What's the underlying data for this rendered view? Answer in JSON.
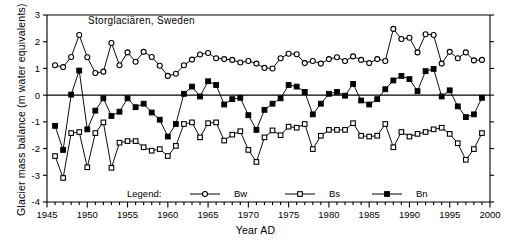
{
  "chart_data": {
    "type": "line",
    "title": "Storglaciären, Sweden",
    "xlabel": "Year AD",
    "ylabel": "Glacier mass balance (m water equivalents)",
    "xlim": [
      1945,
      2000
    ],
    "ylim": [
      -4,
      3
    ],
    "xticks_major": [
      1945,
      1950,
      1955,
      1960,
      1965,
      1970,
      1975,
      1980,
      1985,
      1990,
      1995,
      2000
    ],
    "xticks_minor_step": 1,
    "yticks": [
      -4,
      -3,
      -2,
      -1,
      0,
      1,
      2,
      3
    ],
    "xtick_labels": [
      "1945",
      "1950",
      "1955",
      "1960",
      "1965",
      "1970",
      "1975",
      "1980",
      "1985",
      "1990",
      "1995",
      "2000"
    ],
    "ytick_labels": [
      "-4",
      "-3",
      "-2",
      "-1",
      "0",
      "1",
      "2",
      "3"
    ],
    "grid": false,
    "zero_line": true,
    "legend_title": "Legend:",
    "legend_position": "inside-bottom-center",
    "x": [
      1946,
      1947,
      1948,
      1949,
      1950,
      1951,
      1952,
      1953,
      1954,
      1955,
      1956,
      1957,
      1958,
      1959,
      1960,
      1961,
      1962,
      1963,
      1964,
      1965,
      1966,
      1967,
      1968,
      1969,
      1970,
      1971,
      1972,
      1973,
      1974,
      1975,
      1976,
      1977,
      1978,
      1979,
      1980,
      1981,
      1982,
      1983,
      1984,
      1985,
      1986,
      1987,
      1988,
      1989,
      1990,
      1991,
      1992,
      1993,
      1994,
      1995,
      1996,
      1997,
      1998,
      1999
    ],
    "series": [
      {
        "name": "Bw",
        "marker": "open-circle",
        "color": "#000000",
        "values": [
          1.12,
          1.05,
          1.43,
          2.25,
          1.42,
          0.83,
          0.88,
          1.95,
          1.12,
          1.6,
          1.25,
          1.62,
          1.43,
          1.1,
          0.72,
          0.8,
          1.12,
          1.33,
          1.52,
          1.58,
          1.38,
          1.35,
          1.32,
          1.22,
          1.28,
          1.18,
          1.02,
          1.0,
          1.38,
          1.55,
          1.53,
          1.2,
          1.28,
          1.18,
          1.35,
          1.42,
          1.28,
          1.45,
          1.32,
          1.2,
          1.35,
          1.28,
          2.48,
          2.1,
          2.15,
          1.6,
          2.28,
          2.25,
          1.18,
          1.62,
          1.38,
          1.6,
          1.3,
          1.32
        ]
      },
      {
        "name": "Bs",
        "marker": "open-square",
        "color": "#000000",
        "values": [
          -2.28,
          -3.1,
          -1.42,
          -1.38,
          -2.7,
          -1.42,
          -1.02,
          -2.72,
          -1.78,
          -1.72,
          -1.72,
          -1.95,
          -2.08,
          -2.02,
          -2.28,
          -1.9,
          -1.08,
          -1.02,
          -1.58,
          -1.05,
          -1.02,
          -1.7,
          -1.48,
          -1.35,
          -2.05,
          -2.5,
          -1.58,
          -1.32,
          -1.5,
          -1.18,
          -1.22,
          -1.08,
          -2.02,
          -1.52,
          -1.3,
          -1.3,
          -1.3,
          -1.05,
          -1.52,
          -1.55,
          -1.52,
          -1.08,
          -1.95,
          -1.38,
          -1.55,
          -1.45,
          -1.38,
          -1.28,
          -1.22,
          -1.45,
          -1.8,
          -2.42,
          -2.02,
          -1.42
        ]
      },
      {
        "name": "Bn",
        "marker": "filled-square",
        "color": "#000000",
        "values": [
          -1.15,
          -2.05,
          0.02,
          0.92,
          -1.28,
          -0.58,
          -0.12,
          -0.78,
          -0.62,
          -0.12,
          -0.45,
          -0.32,
          -0.65,
          -0.92,
          -1.55,
          -1.08,
          0.05,
          0.32,
          -0.05,
          0.52,
          0.38,
          -0.35,
          -0.15,
          -0.1,
          -0.75,
          -1.3,
          -0.55,
          -0.32,
          -0.12,
          0.38,
          0.32,
          0.12,
          -0.72,
          -0.32,
          0.05,
          0.12,
          -0.02,
          0.42,
          -0.2,
          -0.35,
          -0.15,
          0.22,
          0.55,
          0.72,
          0.6,
          0.15,
          0.9,
          0.98,
          -0.05,
          0.18,
          -0.42,
          -0.82,
          -0.72,
          -0.1
        ]
      }
    ]
  },
  "legend": {
    "title": "Legend:",
    "entries": [
      {
        "label": "Bw",
        "marker": "open-circle"
      },
      {
        "label": "Bs",
        "marker": "open-square"
      },
      {
        "label": "Bn",
        "marker": "filled-square"
      }
    ]
  },
  "axes": {
    "x_title": "Year AD",
    "y_title": "Glacier mass balance (m water equivalents)"
  },
  "title": "Storglaciären, Sweden"
}
